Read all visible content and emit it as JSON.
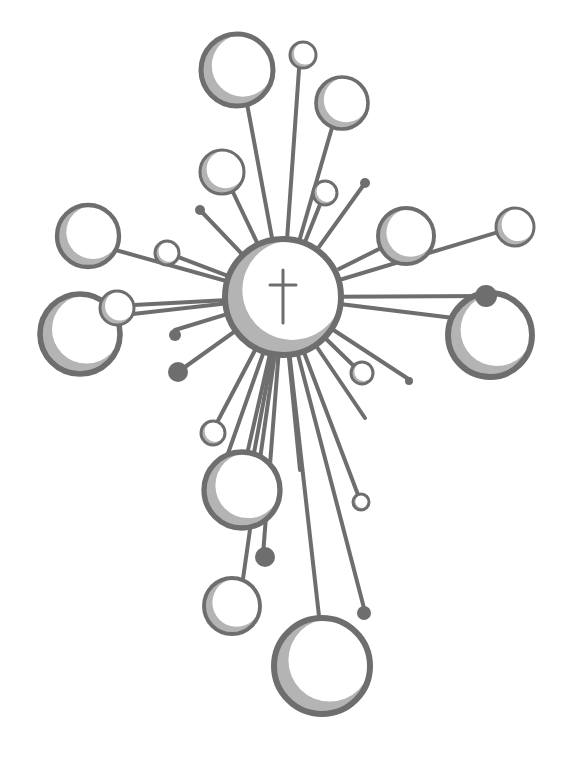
{
  "illustration": {
    "title": "Cross of circles and radiating lines",
    "width": 571,
    "height": 776,
    "colors": {
      "stroke": "#6e6e6e",
      "shadow": "#b4b4b4",
      "fill": "#ffffff",
      "dot": "#6e6e6e",
      "background": "#ffffff"
    },
    "center": {
      "cx": 283,
      "cy": 297,
      "r": 58
    },
    "center_cross": {
      "x": 283,
      "y1": 270,
      "y2": 323,
      "bar_y": 285,
      "bar_x1": 270,
      "bar_x2": 296
    },
    "lines": [
      [
        283,
        297,
        237,
        50
      ],
      [
        283,
        297,
        300,
        55
      ],
      [
        283,
        297,
        340,
        100
      ],
      [
        283,
        297,
        220,
        165
      ],
      [
        283,
        297,
        325,
        192
      ],
      [
        283,
        297,
        365,
        183
      ],
      [
        283,
        297,
        200,
        210
      ],
      [
        283,
        297,
        80,
        240
      ],
      [
        283,
        297,
        165,
        252
      ],
      [
        283,
        297,
        405,
        236
      ],
      [
        283,
        297,
        515,
        227
      ],
      [
        283,
        297,
        488,
        296
      ],
      [
        283,
        297,
        470,
        320
      ],
      [
        283,
        297,
        115,
        306
      ],
      [
        283,
        297,
        80,
        320
      ],
      [
        283,
        297,
        175,
        330
      ],
      [
        283,
        297,
        178,
        372
      ],
      [
        283,
        297,
        410,
        380
      ],
      [
        283,
        297,
        360,
        372
      ],
      [
        283,
        297,
        365,
        418
      ],
      [
        283,
        297,
        212,
        432
      ],
      [
        283,
        297,
        240,
        485
      ],
      [
        283,
        297,
        248,
        485
      ],
      [
        283,
        297,
        263,
        555
      ],
      [
        283,
        297,
        360,
        500
      ],
      [
        283,
        297,
        240,
        600
      ],
      [
        283,
        297,
        320,
        625
      ],
      [
        283,
        297,
        365,
        612
      ],
      [
        283,
        297,
        225,
        462
      ],
      [
        283,
        297,
        300,
        470
      ]
    ],
    "circles": [
      {
        "cx": 237,
        "cy": 70,
        "r": 36,
        "kind": "ring"
      },
      {
        "cx": 303,
        "cy": 55,
        "r": 13,
        "kind": "ring"
      },
      {
        "cx": 342,
        "cy": 103,
        "r": 26,
        "kind": "ring"
      },
      {
        "cx": 222,
        "cy": 172,
        "r": 22,
        "kind": "ring"
      },
      {
        "cx": 325,
        "cy": 193,
        "r": 12,
        "kind": "ring"
      },
      {
        "cx": 88,
        "cy": 236,
        "r": 31,
        "kind": "ring"
      },
      {
        "cx": 167,
        "cy": 253,
        "r": 12,
        "kind": "ring"
      },
      {
        "cx": 406,
        "cy": 236,
        "r": 28,
        "kind": "ring"
      },
      {
        "cx": 515,
        "cy": 227,
        "r": 19,
        "kind": "ring"
      },
      {
        "cx": 80,
        "cy": 334,
        "r": 40,
        "kind": "ring"
      },
      {
        "cx": 117,
        "cy": 308,
        "r": 17,
        "kind": "ring"
      },
      {
        "cx": 490,
        "cy": 335,
        "r": 42,
        "kind": "ring"
      },
      {
        "cx": 362,
        "cy": 373,
        "r": 11,
        "kind": "ring"
      },
      {
        "cx": 213,
        "cy": 433,
        "r": 12,
        "kind": "ring"
      },
      {
        "cx": 242,
        "cy": 490,
        "r": 38,
        "kind": "ring"
      },
      {
        "cx": 361,
        "cy": 502,
        "r": 8,
        "kind": "ring"
      },
      {
        "cx": 232,
        "cy": 606,
        "r": 28,
        "kind": "ring"
      },
      {
        "cx": 322,
        "cy": 666,
        "r": 48,
        "kind": "ring"
      },
      {
        "cx": 365,
        "cy": 183,
        "r": 5,
        "kind": "dot"
      },
      {
        "cx": 200,
        "cy": 210,
        "r": 5,
        "kind": "dot"
      },
      {
        "cx": 486,
        "cy": 296,
        "r": 11,
        "kind": "dot"
      },
      {
        "cx": 175,
        "cy": 335,
        "r": 6,
        "kind": "dot"
      },
      {
        "cx": 178,
        "cy": 372,
        "r": 10,
        "kind": "dot"
      },
      {
        "cx": 409,
        "cy": 381,
        "r": 4,
        "kind": "dot"
      },
      {
        "cx": 265,
        "cy": 557,
        "r": 10,
        "kind": "dot"
      },
      {
        "cx": 364,
        "cy": 613,
        "r": 7,
        "kind": "dot"
      }
    ]
  }
}
